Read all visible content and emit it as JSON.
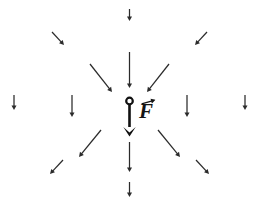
{
  "figure": {
    "background_color": "#ffffff",
    "width": 258,
    "height": 211,
    "field_arrow_color": "#2b2b2b",
    "force_arrow_color": "#111111",
    "point_mass_fill": "#ffffff",
    "point_mass_stroke": "#111111"
  },
  "labels": {
    "force_symbol": "F",
    "force_symbol_name": "force-vector-F",
    "vector_arrow_accent": "vector-arrow-overbar"
  },
  "point_mass": {
    "name": "point-mass-marker",
    "cx": 129.5,
    "cy": 101,
    "r": 3.3
  },
  "force_vector": {
    "name": "net-force-arrow",
    "x1": 129.5,
    "y1": 104.5,
    "x2": 129.5,
    "y2": 127,
    "head_half_width": 6.2,
    "head_length": 9.5,
    "tip_y": 136.5,
    "direction": "down"
  },
  "chart_data": {
    "type": "scatter",
    "xlabel": "",
    "ylabel": "",
    "xlim": [
      0,
      258
    ],
    "ylim": [
      211,
      0
    ],
    "grid": false,
    "legend": null,
    "annotations": [
      {
        "text": "F",
        "kind": "vector-label",
        "x": 145,
        "y": 110
      }
    ],
    "series": [
      {
        "name": "field-arrows",
        "description": "Downward-pointing field arrows; length grows toward the central point mass",
        "arrows": [
          {
            "id": "arrow-top-far",
            "x1": 129.5,
            "y1": 9,
            "x2": 129.5,
            "y2": 21,
            "angle_deg": 90,
            "length": 12
          },
          {
            "id": "arrow-top-near",
            "x1": 129.5,
            "y1": 52,
            "x2": 129.5,
            "y2": 88,
            "angle_deg": 90,
            "length": 36
          },
          {
            "id": "arrow-bottom-near",
            "x1": 129.5,
            "y1": 142,
            "x2": 129.5,
            "y2": 172,
            "angle_deg": 90,
            "length": 30
          },
          {
            "id": "arrow-bottom-far",
            "x1": 129.5,
            "y1": 182,
            "x2": 129.5,
            "y2": 197,
            "angle_deg": 90,
            "length": 15
          },
          {
            "id": "arrow-left-far",
            "x1": 14,
            "y1": 95,
            "x2": 14,
            "y2": 110,
            "angle_deg": 90,
            "length": 15
          },
          {
            "id": "arrow-left-near",
            "x1": 72,
            "y1": 95,
            "x2": 72,
            "y2": 117,
            "angle_deg": 90,
            "length": 22
          },
          {
            "id": "arrow-right-near",
            "x1": 187,
            "y1": 95,
            "x2": 187,
            "y2": 117,
            "angle_deg": 90,
            "length": 22
          },
          {
            "id": "arrow-right-far",
            "x1": 245,
            "y1": 95,
            "x2": 245,
            "y2": 110,
            "angle_deg": 90,
            "length": 15
          },
          {
            "id": "arrow-upper-left-far",
            "x1": 52,
            "y1": 32,
            "x2": 64,
            "y2": 45,
            "angle_deg": 47,
            "length": 17
          },
          {
            "id": "arrow-upper-left-near",
            "x1": 90,
            "y1": 64,
            "x2": 112,
            "y2": 92,
            "angle_deg": 52,
            "length": 35
          },
          {
            "id": "arrow-upper-right-far",
            "x1": 207,
            "y1": 32,
            "x2": 195,
            "y2": 45,
            "angle_deg": 133,
            "length": 17
          },
          {
            "id": "arrow-upper-right-near",
            "x1": 169,
            "y1": 64,
            "x2": 147,
            "y2": 92,
            "angle_deg": 128,
            "length": 35
          },
          {
            "id": "arrow-lower-left-near",
            "x1": 101,
            "y1": 130,
            "x2": 79,
            "y2": 157,
            "angle_deg": 129,
            "length": 34
          },
          {
            "id": "arrow-lower-left-far",
            "x1": 63,
            "y1": 160,
            "x2": 50,
            "y2": 174,
            "angle_deg": 133,
            "length": 19
          },
          {
            "id": "arrow-lower-right-near",
            "x1": 158,
            "y1": 130,
            "x2": 180,
            "y2": 157,
            "angle_deg": 51,
            "length": 34
          },
          {
            "id": "arrow-lower-right-far",
            "x1": 196,
            "y1": 160,
            "x2": 209,
            "y2": 174,
            "angle_deg": 47,
            "length": 19
          }
        ]
      }
    ]
  }
}
